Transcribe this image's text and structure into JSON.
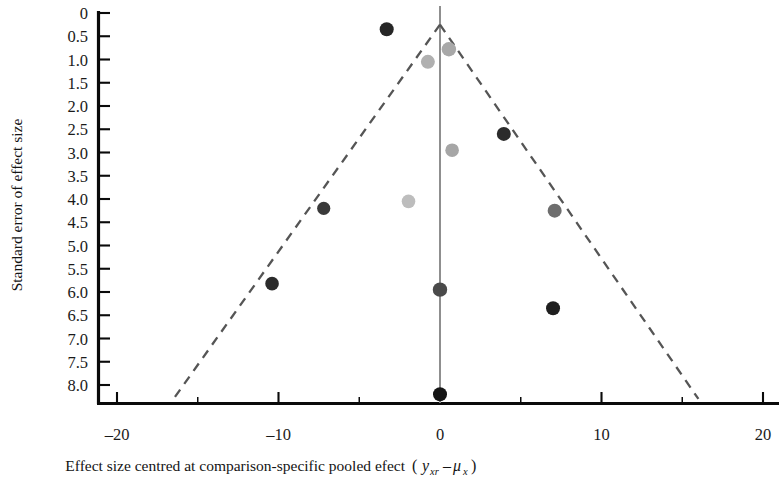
{
  "chart_data": {
    "type": "scatter",
    "title": "",
    "subtitle": "",
    "xlabel": "Effect size centred at comparison-specific pooled efect",
    "xlabel_math_open": "(",
    "xlabel_math_y": "y",
    "xlabel_math_y_sub": "xr",
    "xlabel_math_minus": "–",
    "xlabel_math_mu": "μ",
    "xlabel_math_mu_sub": "x",
    "xlabel_math_close": ")",
    "ylabel": "Standard error of effect size",
    "xlim": [
      -21.2,
      21.0
    ],
    "ylim": [
      0,
      8.4
    ],
    "y_inverted": true,
    "grid": false,
    "legend": "none",
    "xticks": [
      -20,
      -10,
      0,
      10,
      20
    ],
    "xticklabels": [
      "–20",
      "–10",
      "0",
      "10",
      "20"
    ],
    "yticks": [
      0,
      0.5,
      1.0,
      1.5,
      2.0,
      2.5,
      3.0,
      3.5,
      4.0,
      4.5,
      5.0,
      5.5,
      6.0,
      6.5,
      7.0,
      7.5,
      8.0
    ],
    "yticklabels": [
      "0",
      "0.5",
      "1.0",
      "1.5",
      "2.0",
      "2.5",
      "3.0",
      "3.5",
      "4.0",
      "4.5",
      "5.0",
      "5.5",
      "6.0",
      "6.5",
      "7.0",
      "7.5",
      "8.0"
    ],
    "x_minor_ticks": [
      -15,
      -5,
      5,
      15
    ],
    "reference_line": {
      "x": 0,
      "color": "#8a8a8a",
      "style": "solid"
    },
    "funnel": {
      "apex": {
        "x": 0,
        "y": 0.25
      },
      "left_end": {
        "x": -16.5,
        "y": 8.3
      },
      "right_end": {
        "x": 16.0,
        "y": 8.3
      },
      "color": "#555555",
      "style": "dashed"
    },
    "points": [
      {
        "x": -3.3,
        "y": 0.35,
        "color": "#262626",
        "r": 7.0
      },
      {
        "x": 0.55,
        "y": 0.78,
        "color": "#a8a8a8",
        "r": 7.2
      },
      {
        "x": -0.75,
        "y": 1.05,
        "color": "#b0b0b0",
        "r": 7.0
      },
      {
        "x": 3.95,
        "y": 2.6,
        "color": "#2b2b2b",
        "r": 7.0
      },
      {
        "x": 0.75,
        "y": 2.95,
        "color": "#a6a6a6",
        "r": 6.8
      },
      {
        "x": -1.95,
        "y": 4.05,
        "color": "#bdbdbd",
        "r": 6.8
      },
      {
        "x": -7.2,
        "y": 4.2,
        "color": "#3a3a3a",
        "r": 6.6
      },
      {
        "x": 7.1,
        "y": 4.25,
        "color": "#6e6e6e",
        "r": 7.0
      },
      {
        "x": -10.4,
        "y": 5.82,
        "color": "#2b2b2b",
        "r": 6.8
      },
      {
        "x": 0.0,
        "y": 5.95,
        "color": "#4a4a4a",
        "r": 7.2
      },
      {
        "x": 7.0,
        "y": 6.35,
        "color": "#1f1f1f",
        "r": 7.0
      },
      {
        "x": 0.0,
        "y": 8.2,
        "color": "#151515",
        "r": 7.0
      }
    ]
  }
}
